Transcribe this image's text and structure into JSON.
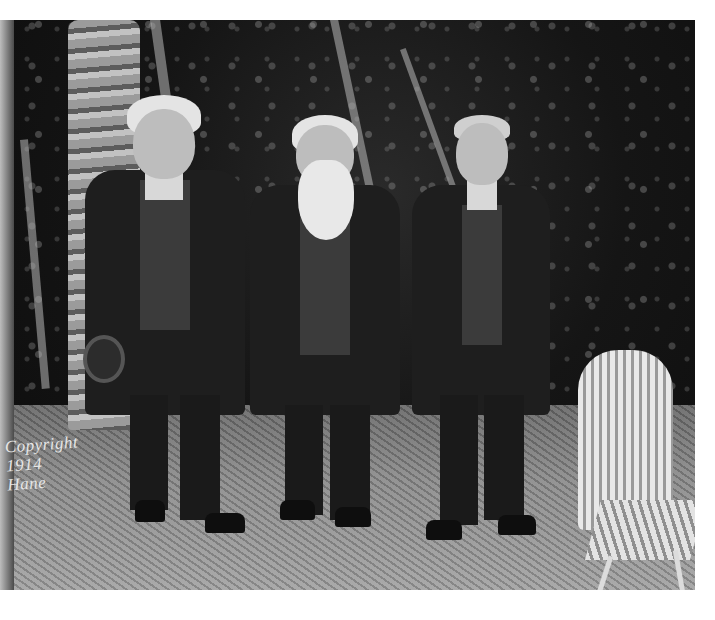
{
  "image": {
    "description": "Black-and-white historical photograph of three elderly men in dark suits standing outdoors among palm trees, with a white wicker chair at right",
    "width": 715,
    "height": 620,
    "background_color": "#ffffff"
  },
  "photo": {
    "tone": "grayscale",
    "subjects": [
      {
        "position": "left",
        "description": "white-haired man in dark suit and vest, holding a hat"
      },
      {
        "position": "center",
        "description": "man with long white beard in dark suit"
      },
      {
        "position": "right",
        "description": "man in dark three-piece suit with tie"
      }
    ],
    "objects": [
      "palm tree trunk",
      "palm fronds",
      "white wicker chair",
      "grass ground"
    ]
  },
  "watermark": {
    "text": "Copyright\n1914\nHane"
  }
}
